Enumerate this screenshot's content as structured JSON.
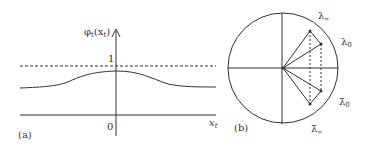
{
  "panel_a": {
    "label": "(a)",
    "y_axis_label": "φ",
    "y_axis_sub": "t",
    "y_axis_arg": "(x",
    "y_axis_arg_sub": "t",
    "y_axis_close": ")",
    "tick_one": "1",
    "origin": "0",
    "x_axis_label": "x",
    "x_axis_sub": "t"
  },
  "panel_b": {
    "label": "(b)",
    "lambda_inf": "λ",
    "lambda_inf_sub": "∞",
    "lambda_0": "λ",
    "lambda_0_sub": "0",
    "lambda_0_bar": "λ̄",
    "lambda_0_bar_sub": "0",
    "lambda_inf_bar": "λ̄",
    "lambda_inf_bar_sub": "∞"
  },
  "colors": {
    "ink": "#333333",
    "background": "#ffffff"
  }
}
